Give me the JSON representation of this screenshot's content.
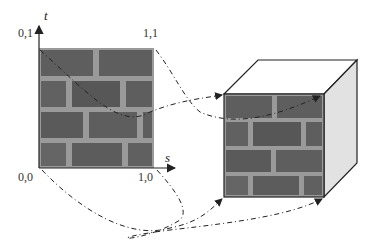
{
  "diagram": {
    "texture": {
      "axis_vertical": "t",
      "axis_horizontal": "s",
      "corners": {
        "top_left": "0,1",
        "top_right": "1,1",
        "bottom_left": "0,0",
        "bottom_right": "1,0"
      }
    },
    "colors": {
      "brick": "#5e5e5e",
      "mortar": "#9a9a9a",
      "cube_top": "#ffffff",
      "cube_side": "#e2e2e2",
      "line": "#222222"
    },
    "mappings": [
      {
        "from": "0,1",
        "to": "cube front top-left"
      },
      {
        "from": "1,1",
        "to": "cube front top-right"
      },
      {
        "from": "0,0",
        "to": "cube front bottom-left"
      },
      {
        "from": "1,0",
        "to": "cube front bottom-right"
      }
    ]
  }
}
